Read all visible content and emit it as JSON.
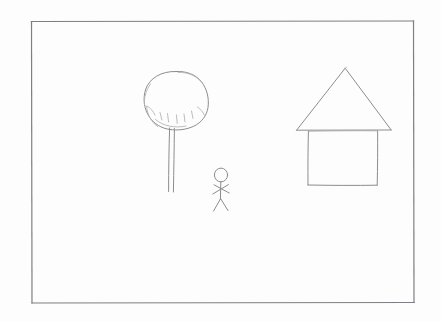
{
  "artwork": {
    "title": "Hand-drawn pencil sketch",
    "medium": "pencil on white paper",
    "caption": "A pencil drawing inside a hand-ruled rectangular border showing a tree on the left, a small stick figure person in the middle, and a house with a triangular roof on the right.",
    "background_color": "#fdfdfd",
    "stroke_color": "#8d8d90",
    "faint_stroke_color": "#b4b4b8",
    "frame_stroke_color": "#7f7f83"
  },
  "frame": {
    "label": "Drawing border",
    "x": 31,
    "y": 21,
    "width": 383,
    "height": 282
  },
  "objects": [
    {
      "id": "tree",
      "label": "Tree",
      "parts": [
        "crown",
        "trunk",
        "shading-marks"
      ],
      "crown_center_x": 176,
      "crown_center_y": 100,
      "crown_radius_x": 32,
      "crown_radius_y": 29,
      "trunk_top_y": 128,
      "trunk_bottom_y": 192,
      "trunk_left_x": 169,
      "trunk_right_x": 174
    },
    {
      "id": "stick-figure",
      "label": "Stick figure person",
      "parts": [
        "head",
        "body",
        "arms",
        "legs"
      ],
      "head_center_x": 221,
      "head_center_y": 175,
      "head_radius": 6.5,
      "body_top_y": 182,
      "body_bottom_y": 199,
      "arms_y": 189,
      "legs_bottom_y": 211
    },
    {
      "id": "house",
      "label": "House",
      "parts": [
        "roof",
        "walls"
      ],
      "roof_apex_x": 345,
      "roof_apex_y": 68,
      "roof_left_x": 296,
      "roof_right_x": 391,
      "roof_base_y": 130,
      "wall_left_x": 308,
      "wall_right_x": 378,
      "wall_bottom_y": 185
    }
  ]
}
